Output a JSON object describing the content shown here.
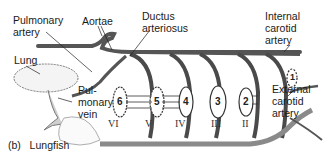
{
  "figure": {
    "caption_letter": "(b)",
    "caption_text": "Lungfish",
    "labels": {
      "pulmonary_artery_1": "Pulmonary",
      "pulmonary_artery_2": "artery",
      "aortae": "Aortae",
      "ductus_1": "Ductus",
      "ductus_2": "arteriosus",
      "internal_1": "Internal",
      "internal_2": "carotid",
      "internal_3": "artery",
      "lung": "Lung",
      "pulvein_1": "Pul-",
      "pulvein_2": "monary",
      "pulvein_3": "vein",
      "external_1": "External",
      "external_2": "carotid",
      "external_3": "artery"
    },
    "arch_numbers": [
      "1",
      "2",
      "3",
      "4",
      "5",
      "6"
    ],
    "roman_numerals": [
      "VI",
      "V",
      "IV",
      "III",
      "II"
    ],
    "colors": {
      "vessel": "#555555",
      "vessel_light": "#9a9a9a",
      "line": "#222222"
    }
  }
}
